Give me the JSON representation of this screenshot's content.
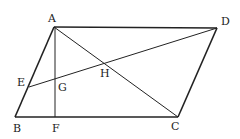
{
  "figure": {
    "type": "geometry",
    "shape": "parallelogram ABCD",
    "stroke_color": "#222222",
    "background": "#ffffff",
    "points": {
      "A": {
        "x": 54,
        "y": 27
      },
      "D": {
        "x": 217,
        "y": 28
      },
      "B": {
        "x": 15,
        "y": 117
      },
      "C": {
        "x": 178,
        "y": 117
      },
      "E": {
        "x": 29,
        "y": 87
      },
      "F": {
        "x": 55,
        "y": 117
      },
      "G": {
        "x": 55,
        "y": 80
      },
      "H": {
        "x": 104,
        "y": 63
      }
    },
    "labels": {
      "A": "A",
      "B": "B",
      "C": "C",
      "D": "D",
      "E": "E",
      "F": "F",
      "G": "G",
      "H": "H"
    },
    "segments": [
      "AD",
      "BC",
      "AB",
      "DC",
      "AC",
      "AF",
      "ED"
    ]
  }
}
